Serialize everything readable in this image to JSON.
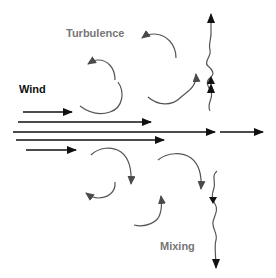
{
  "diagram": {
    "labels": {
      "turbulence": "Turbulence",
      "wind": "Wind",
      "mixing": "Mixing"
    },
    "colors": {
      "wind_arrows": "#111111",
      "eddy_arrows": "#555555",
      "label_gray": "#767676",
      "label_black": "#111111"
    },
    "wind_arrows": [
      {
        "y": 112,
        "x1": 23,
        "x2": 72
      },
      {
        "y": 122,
        "x1": 18,
        "x2": 151
      },
      {
        "y": 132,
        "x1": 13,
        "x2": 215
      },
      {
        "y": 140,
        "x1": 16,
        "x2": 164
      },
      {
        "y": 150,
        "x1": 26,
        "x2": 76
      }
    ],
    "outflow_arrow": {
      "y": 132,
      "x1": 220,
      "x2": 263
    },
    "eddies_upper_count": 4,
    "eddies_lower_count": 4,
    "vertical_wavy_arrows": [
      {
        "direction": "up",
        "x": 211,
        "y_top": 12,
        "y_bottom": 111
      },
      {
        "direction": "down",
        "x": 214,
        "y_top": 170,
        "y_bottom": 270
      }
    ]
  }
}
